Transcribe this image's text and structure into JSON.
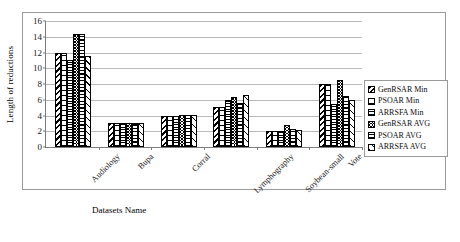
{
  "chart_data": {
    "type": "bar",
    "title": "",
    "xlabel": "Datasets Name",
    "ylabel": "Length of reductions",
    "categories": [
      "Audiology",
      "Bupa",
      "Corral",
      "Lymphography",
      "Soybean-small",
      "Vote"
    ],
    "ylim": [
      0,
      16
    ],
    "yticks": [
      0,
      2,
      4,
      6,
      8,
      10,
      12,
      14,
      16
    ],
    "grid": true,
    "legend_position": "right",
    "series": [
      {
        "name": "GenRSAR Min",
        "pattern": "diagonal-stripes",
        "values": [
          12.0,
          3.0,
          4.0,
          5.1,
          2.0,
          8.0
        ]
      },
      {
        "name": "PSOAR Min",
        "pattern": "vertical-dashes",
        "values": [
          12.0,
          3.0,
          4.0,
          5.1,
          2.0,
          8.0
        ]
      },
      {
        "name": "ARRSFA Min",
        "pattern": "fine-grid",
        "values": [
          11.0,
          3.0,
          4.0,
          6.0,
          2.0,
          5.5
        ]
      },
      {
        "name": "GenRSAR AVG",
        "pattern": "checkerboard",
        "values": [
          14.3,
          3.0,
          4.1,
          6.3,
          2.8,
          8.5
        ]
      },
      {
        "name": "PSOAR AVG",
        "pattern": "horizontal-lines",
        "values": [
          14.3,
          3.0,
          4.1,
          5.6,
          2.3,
          6.5
        ]
      },
      {
        "name": "ARRSFA AVG",
        "pattern": "crosshatch",
        "values": [
          11.5,
          3.0,
          4.1,
          6.6,
          2.2,
          6.0
        ]
      }
    ]
  },
  "legend": {
    "items": [
      {
        "label": "GenRSAR Min"
      },
      {
        "label": "PSOAR Min"
      },
      {
        "label": "ARRSFA Min"
      },
      {
        "label": "GenRSAR AVG"
      },
      {
        "label": "PSOAR AVG"
      },
      {
        "label": "ARRSFA AVG"
      }
    ]
  },
  "colors": {
    "plot_background": "#ffffff",
    "frame": "#9a9a9a",
    "axis": "#7d7d7d",
    "gridline": "#b9b9b9",
    "bar_outline": "#000000",
    "text": "#1a1a1a"
  }
}
